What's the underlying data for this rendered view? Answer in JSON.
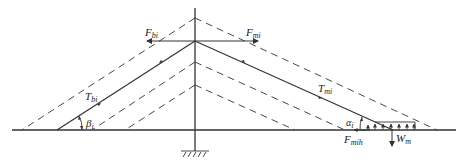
{
  "figure": {
    "colors": {
      "line": "#333333",
      "background": "#ffffff"
    }
  },
  "labels": {
    "F_bi": {
      "main": "F",
      "sub": "bi"
    },
    "F_mi": {
      "main": "F",
      "sub": "mi"
    },
    "T_bi": {
      "main": "T",
      "sub": "bi"
    },
    "T_mi": {
      "main": "T",
      "sub": "mi"
    },
    "beta_i": {
      "main": "β",
      "sub": "i"
    },
    "alpha_i": {
      "main": "α",
      "sub": "i"
    },
    "F_mih": {
      "main": "F",
      "sub": "mih"
    },
    "W_m": {
      "main": "W",
      "sub": "m"
    }
  },
  "elements": {
    "mast": "vertical mast with fixed support (hatched base)",
    "ground": "horizontal ground line",
    "back_stay": "solid cable to left ground anchor",
    "main_stay": "solid cable to right anchor block",
    "dashed_stays": "dashed alternative cable positions",
    "anchor_block": "rectangular block with distributed upward reaction arrows"
  }
}
